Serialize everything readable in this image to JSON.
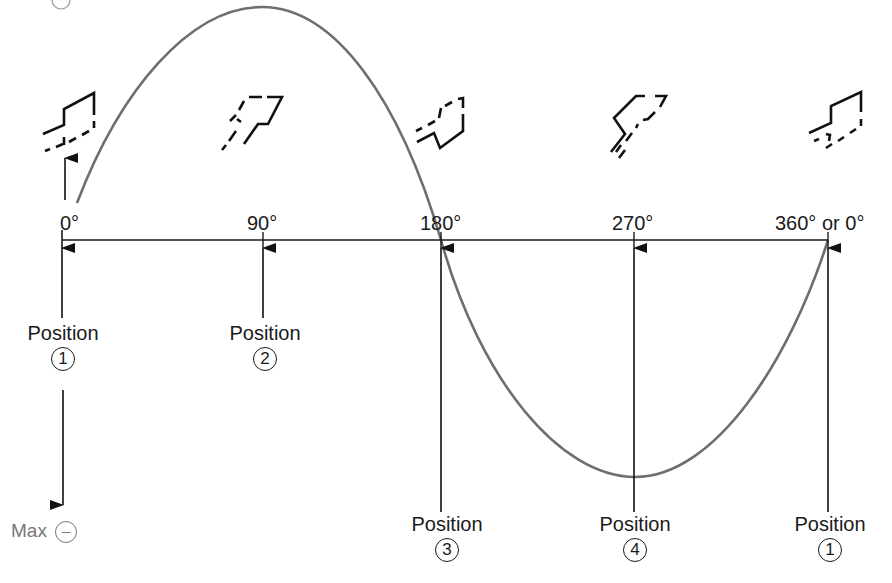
{
  "diagram": {
    "type": "AC sine wave generation diagram (rotating coil positions)",
    "axis_labels": [
      "0°",
      "90°",
      "180°",
      "270°",
      "360° or 0°"
    ],
    "positions": [
      {
        "label": "Position",
        "number": "1",
        "angle": "0°"
      },
      {
        "label": "Position",
        "number": "2",
        "angle": "90°"
      },
      {
        "label": "Position",
        "number": "3",
        "angle": "180°"
      },
      {
        "label": "Position",
        "number": "4",
        "angle": "270°"
      },
      {
        "label": "Position",
        "number": "1",
        "angle": "360°"
      }
    ],
    "max_negative": {
      "label": "Max",
      "symbol": "–"
    },
    "coil_icons": [
      "coil-0deg-icon",
      "coil-90deg-icon",
      "coil-180deg-icon",
      "coil-270deg-icon",
      "coil-360deg-icon"
    ],
    "colors": {
      "curve": "#6e6e6e",
      "line": "#1a1a1a",
      "max_label": "#777777"
    }
  }
}
